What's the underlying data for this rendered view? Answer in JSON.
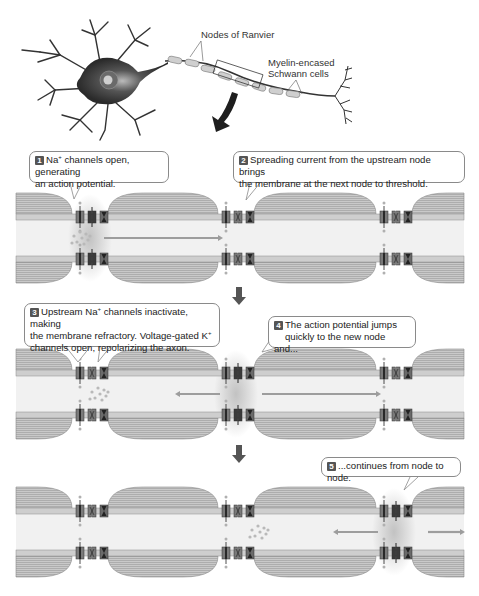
{
  "overview": {
    "labels": {
      "nodes_of_ranvier": "Nodes of Ranvier",
      "myelin_line1": "Myelin-encased",
      "myelin_line2": "Schwann cells"
    }
  },
  "steps": [
    {
      "number": "1",
      "text_a": "Na",
      "sup_a": "+",
      "text_b": " channels open, generating",
      "line2": "an action potential."
    },
    {
      "number": "2",
      "line1": "Spreading current from the upstream node brings",
      "line2": "the membrane at the next node to threshold."
    },
    {
      "number": "3",
      "text_a": "Upstream Na",
      "sup_a": "+",
      "text_b": " channels inactivate, making",
      "line2a": "the membrane refractory. Voltage-gated K",
      "sup_b": "+",
      "line3": "channels open, repolarizing the axon."
    },
    {
      "number": "4",
      "line1": "The action potential jumps",
      "line2": "quickly to the new node and..."
    },
    {
      "number": "5",
      "line1": "...continues from node to node."
    }
  ],
  "panels": [
    {
      "id": "panel-1",
      "y": 193,
      "active_nodes": [
        0
      ],
      "current_arrows": [
        {
          "x1": 104,
          "x2": 218,
          "dir": "right"
        }
      ],
      "ion_cluster_x": 80
    },
    {
      "id": "panel-2",
      "y": 349,
      "active_nodes": [
        1
      ],
      "current_arrows": [
        {
          "x1": 180,
          "x2": 220,
          "dir": "left"
        },
        {
          "x1": 262,
          "x2": 376,
          "dir": "right"
        }
      ],
      "ion_cluster_x": 98
    },
    {
      "id": "panel-3",
      "y": 487,
      "active_nodes": [
        2
      ],
      "current_arrows": [
        {
          "x1": 338,
          "x2": 378,
          "dir": "left"
        },
        {
          "x1": 428,
          "x2": 460,
          "dir": "right"
        }
      ],
      "ion_cluster_x": 258
    }
  ],
  "colors": {
    "myelin_fill": "#c9c9c9",
    "myelin_lines": "#9a9a9a",
    "membrane": "#8c8c8c",
    "axoplasm": "#f1f1f1",
    "channel_dark": "#4a4a4a",
    "channel_mid": "#7a7a7a",
    "arrow": "#9d9d9d",
    "flow_arrow": "#555555",
    "glow": "#bdbdbd"
  }
}
